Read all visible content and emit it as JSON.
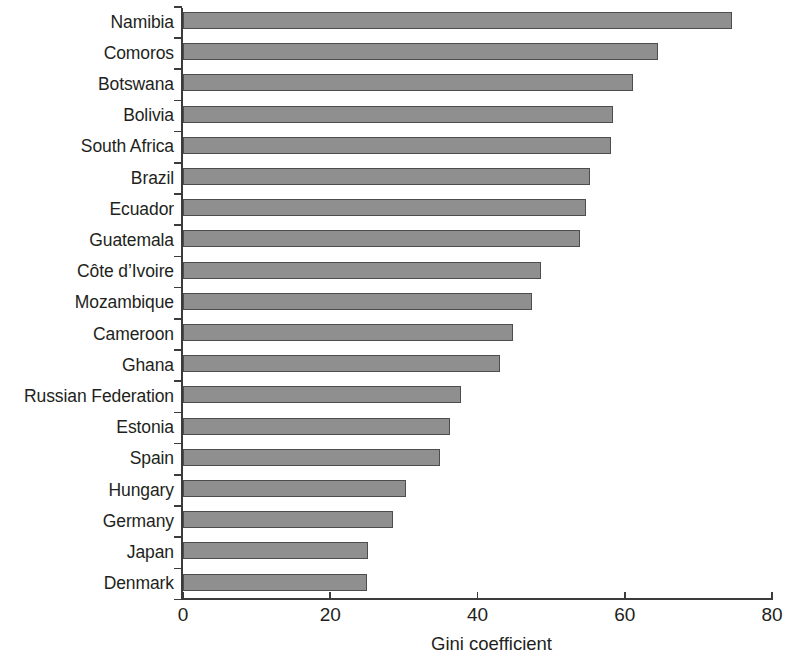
{
  "chart_data": {
    "type": "bar",
    "orientation": "horizontal",
    "title": "",
    "xlabel": "Gini coefficient",
    "ylabel": "",
    "xlim": [
      0,
      80
    ],
    "xticks": [
      0,
      20,
      40,
      60,
      80
    ],
    "grid": false,
    "legend": false,
    "categories": [
      "Namibia",
      "Comoros",
      "Botswana",
      "Bolivia",
      "South Africa",
      "Brazil",
      "Ecuador",
      "Guatemala",
      "Côte d’Ivoire",
      "Mozambique",
      "Cameroon",
      "Ghana",
      "Russian Federation",
      "Estonia",
      "Spain",
      "Hungary",
      "Germany",
      "Japan",
      "Denmark"
    ],
    "values": [
      74.3,
      64.3,
      60.8,
      58.2,
      57.8,
      55.0,
      54.4,
      53.7,
      48.4,
      47.1,
      44.6,
      42.8,
      37.5,
      36.0,
      34.7,
      30.0,
      28.3,
      24.9,
      24.7
    ],
    "bar_color": "#8f8f8f",
    "bar_edge_color": "#4d4d4d",
    "axis_color": "#3b3b3b"
  }
}
